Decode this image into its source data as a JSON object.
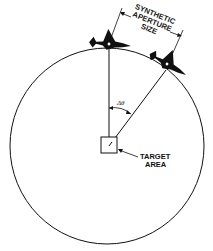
{
  "diagram": {
    "type": "spotlight-sar-geometry",
    "labels": {
      "aperture_line1": "SYNTHETIC",
      "aperture_line2": "APERTURE",
      "aperture_line3": "SIZE",
      "target_line1": "TARGET",
      "target_line2": "AREA",
      "angle": "Δθ"
    },
    "elements": {
      "orbit": "circular flight path",
      "aircraft": [
        "aircraft-position-1",
        "aircraft-position-2"
      ],
      "target": "target area box"
    },
    "colors": {
      "ink": "#111111",
      "background": "#ffffff"
    }
  }
}
